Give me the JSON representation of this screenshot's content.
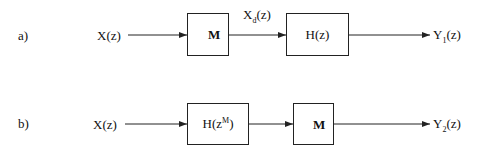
{
  "diagram": {
    "type": "block-diagram",
    "rows": [
      {
        "label": "a)",
        "input": {
          "name": "X",
          "arg": "(z)"
        },
        "blocks": [
          {
            "kind": "downsampler",
            "text": "M"
          },
          {
            "kind": "filter",
            "name": "H",
            "arg": "(z)"
          }
        ],
        "intermediate": {
          "name": "X",
          "sub": "d",
          "arg": "(z)"
        },
        "output": {
          "name": "Y",
          "sub": "1",
          "arg": "(z)"
        }
      },
      {
        "label": "b)",
        "input": {
          "name": "X",
          "arg": "(z)"
        },
        "blocks": [
          {
            "kind": "filter",
            "name": "H(z",
            "sup": "M",
            "close": ")"
          },
          {
            "kind": "downsampler",
            "text": "M"
          }
        ],
        "output": {
          "name": "Y",
          "sub": "2",
          "arg": "(z)"
        }
      }
    ],
    "colors": {
      "stroke": "#222222",
      "background": "#ffffff"
    }
  }
}
